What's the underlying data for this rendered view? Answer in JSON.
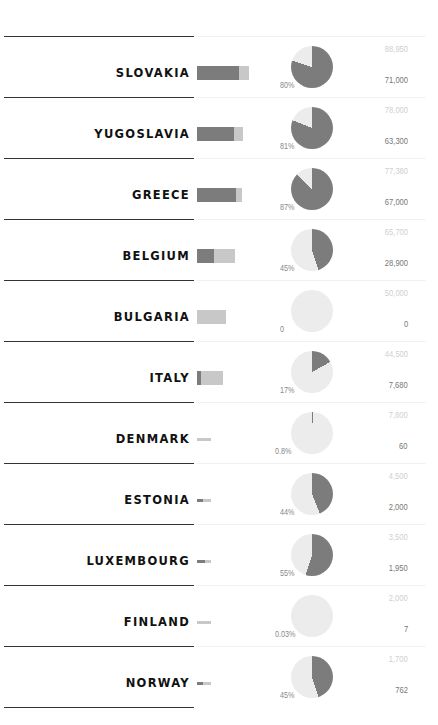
{
  "chart_data": {
    "type": "table",
    "title": "",
    "colors": {
      "value": "#7c7c7c",
      "remainder": "#c8c8c8",
      "pie_remainder": "#ececec"
    },
    "rows": [
      {
        "country": "SLOVAKIA",
        "total": 88950,
        "value": 71000,
        "percent": 80,
        "pct_label": "80%",
        "total_label": "88,950",
        "value_label": "71,000"
      },
      {
        "country": "YUGOSLAVIA",
        "total": 78000,
        "value": 63300,
        "percent": 81,
        "pct_label": "81%",
        "total_label": "78,000",
        "value_label": "63,300"
      },
      {
        "country": "GREECE",
        "total": 77380,
        "value": 67000,
        "percent": 87,
        "pct_label": "87%",
        "total_label": "77,380",
        "value_label": "67,000"
      },
      {
        "country": "BELGIUM",
        "total": 65700,
        "value": 28900,
        "percent": 45,
        "pct_label": "45%",
        "total_label": "65,700",
        "value_label": "28,900"
      },
      {
        "country": "BULGARIA",
        "total": 50000,
        "value": 0,
        "percent": 0,
        "pct_label": "0",
        "total_label": "50,000",
        "value_label": "0"
      },
      {
        "country": "ITALY",
        "total": 44500,
        "value": 7680,
        "percent": 17,
        "pct_label": "17%",
        "total_label": "44,500",
        "value_label": "7,680"
      },
      {
        "country": "DENMARK",
        "total": 7800,
        "value": 60,
        "percent": 0.8,
        "pct_label": "0.8%",
        "total_label": "7,800",
        "value_label": "60"
      },
      {
        "country": "ESTONIA",
        "total": 4500,
        "value": 2000,
        "percent": 44,
        "pct_label": "44%",
        "total_label": "4,500",
        "value_label": "2,000"
      },
      {
        "country": "LUXEMBOURG",
        "total": 3500,
        "value": 1950,
        "percent": 55,
        "pct_label": "55%",
        "total_label": "3,500",
        "value_label": "1,950"
      },
      {
        "country": "FINLAND",
        "total": 2000,
        "value": 7,
        "percent": 0.03,
        "pct_label": "0.03%",
        "total_label": "2,000",
        "value_label": "7"
      },
      {
        "country": "NORWAY",
        "total": 1700,
        "value": 762,
        "percent": 45,
        "pct_label": "45%",
        "total_label": "1,700",
        "value_label": "762"
      }
    ]
  }
}
